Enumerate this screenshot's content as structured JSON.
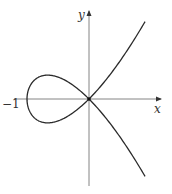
{
  "figure": {
    "equation": "y^2 = x^2(x+1)",
    "x_axis_label": "x",
    "y_axis_label": "y",
    "tick_labels": [
      {
        "value": -1,
        "text": "−1"
      }
    ],
    "colors": {
      "curve": "#2a2a2a",
      "axis": "#555555",
      "background": "#ffffff"
    },
    "geometry": {
      "origin_px": [
        89,
        99
      ],
      "scale_px_per_unit": 62,
      "x_range": [
        -1.2,
        1.15
      ],
      "y_range": [
        -1.4,
        1.4
      ],
      "t_range": [
        -1.38,
        1.38
      ]
    }
  }
}
